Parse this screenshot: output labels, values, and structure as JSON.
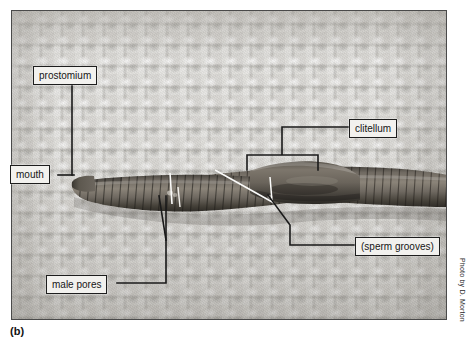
{
  "figure": {
    "panel_letter": "(b)",
    "credit": "Photo by D. Morton"
  },
  "labels": {
    "prostomium": "prostomium",
    "mouth": "mouth",
    "clitellum": "clitellum",
    "sperm_grooves": "(sperm grooves)",
    "male_pores": "male pores"
  },
  "colors": {
    "label_fill": "#f2f1ee",
    "label_border": "#1d1d1d",
    "leader_line": "#1a1a1a",
    "pointer_line": "#ffffff",
    "photo_border": "#4a4a4a",
    "cloth_base": "#cbc9c3",
    "worm_body": "#6b665f",
    "worm_dark": "#3d3a35",
    "page_background": "#ffffff"
  },
  "photo": {
    "subject": "earthworm-ventral-anterior",
    "background_texture": "waffle-weave-cloth"
  }
}
